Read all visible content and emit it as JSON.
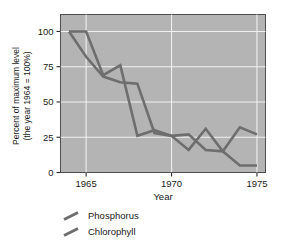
{
  "chart_data": {
    "type": "line",
    "title": "",
    "xlabel": "Year",
    "ylabel": "Percent of maximum level (the year 1964 = 100%)",
    "ylabel_line1": "Percent of maximum level",
    "ylabel_line2": "(the year 1964 = 100%)",
    "xlim": [
      1963.5,
      1975.5
    ],
    "ylim": [
      0,
      112
    ],
    "grid": true,
    "grid_color": "#f0f0f0",
    "plot_background": "#b4b4b4",
    "legend_position": "below-plot-left",
    "yticks": [
      0,
      25,
      50,
      75,
      100
    ],
    "ytick_labels": [
      "0",
      "25",
      "50",
      "75",
      "100"
    ],
    "xticks": [
      1965,
      1970,
      1975
    ],
    "xtick_labels": [
      "1965",
      "1970",
      "1975"
    ],
    "x": [
      1964,
      1965,
      1966,
      1967,
      1968,
      1969,
      1970,
      1971,
      1972,
      1973,
      1974,
      1975
    ],
    "series": [
      {
        "name": "Phosphorus",
        "color": "#6e6e6e",
        "values": [
          100,
          100,
          69,
          76,
          26,
          30,
          26,
          16,
          31,
          15,
          5,
          5
        ]
      },
      {
        "name": "Chlorophyll",
        "color": "#6e6e6e",
        "values": [
          100,
          82,
          68,
          64,
          63,
          28,
          26,
          27,
          16,
          15,
          32,
          27
        ]
      }
    ]
  },
  "legend": {
    "items": [
      {
        "label": "Phosphorus",
        "color": "#6e6e6e"
      },
      {
        "label": "Chlorophyll",
        "color": "#6e6e6e"
      }
    ]
  }
}
